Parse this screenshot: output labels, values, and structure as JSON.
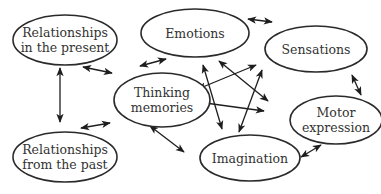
{
  "diagram": {
    "type": "concept-network",
    "colors": {
      "stroke": "#2a2a2a",
      "text": "#333333",
      "background": "#ffffff"
    },
    "nodes": [
      {
        "id": "relationships-present",
        "lines": [
          "Relationships",
          "in the present"
        ],
        "cx": 65,
        "cy": 40,
        "rx": 52,
        "ry": 25
      },
      {
        "id": "emotions",
        "lines": [
          "Emotions"
        ],
        "cx": 195,
        "cy": 33,
        "rx": 54,
        "ry": 24
      },
      {
        "id": "sensations",
        "lines": [
          "Sensations"
        ],
        "cx": 316,
        "cy": 49,
        "rx": 51,
        "ry": 23
      },
      {
        "id": "thinking-memories",
        "lines": [
          "Thinking",
          "memories"
        ],
        "cx": 162,
        "cy": 100,
        "rx": 48,
        "ry": 27
      },
      {
        "id": "motor-expression",
        "lines": [
          "Motor",
          "expression"
        ],
        "cx": 336,
        "cy": 120,
        "rx": 46,
        "ry": 24
      },
      {
        "id": "relationships-past",
        "lines": [
          "Relationships",
          "from the past"
        ],
        "cx": 65,
        "cy": 157,
        "rx": 52,
        "ry": 25
      },
      {
        "id": "imagination",
        "lines": [
          "Imagination"
        ],
        "cx": 250,
        "cy": 158,
        "rx": 50,
        "ry": 23
      }
    ],
    "edges": [
      {
        "from": "relationships-present",
        "to": "relationships-past",
        "x1": 60,
        "y1": 68,
        "x2": 60,
        "y2": 122,
        "bidirectional": true
      },
      {
        "from": "relationships-present",
        "to": "thinking-memories",
        "x1": 83,
        "y1": 67,
        "x2": 112,
        "y2": 73,
        "bidirectional": true
      },
      {
        "from": "thinking-memories",
        "to": "emotions",
        "x1": 140,
        "y1": 66,
        "x2": 166,
        "y2": 59,
        "bidirectional": true
      },
      {
        "from": "emotions",
        "to": "sensations",
        "x1": 248,
        "y1": 19,
        "x2": 272,
        "y2": 22,
        "bidirectional": true
      },
      {
        "from": "sensations",
        "to": "motor-expression",
        "x1": 352,
        "y1": 75,
        "x2": 361,
        "y2": 95,
        "bidirectional": true
      },
      {
        "from": "thinking-memories",
        "to": "relationships-past",
        "x1": 110,
        "y1": 123,
        "x2": 81,
        "y2": 128,
        "bidirectional": true
      },
      {
        "from": "thinking-memories",
        "to": "imagination",
        "x1": 150,
        "y1": 126,
        "x2": 184,
        "y2": 152,
        "bidirectional": true
      },
      {
        "from": "imagination",
        "to": "motor-expression",
        "x1": 301,
        "y1": 157,
        "x2": 321,
        "y2": 145,
        "bidirectional": true
      },
      {
        "from": "thinking-memories",
        "to": "sensations",
        "x1": 198,
        "y1": 89,
        "x2": 256,
        "y2": 65,
        "bidirectional": true
      },
      {
        "from": "thinking-memories",
        "to": "motor-expression",
        "x1": 198,
        "y1": 102,
        "x2": 264,
        "y2": 111,
        "bidirectional": true
      },
      {
        "from": "emotions",
        "to": "imagination",
        "x1": 203,
        "y1": 65,
        "x2": 222,
        "y2": 129,
        "bidirectional": true
      },
      {
        "from": "emotions",
        "to": "motor-expression",
        "x1": 219,
        "y1": 61,
        "x2": 268,
        "y2": 101,
        "bidirectional": true
      },
      {
        "from": "sensations",
        "to": "imagination",
        "x1": 262,
        "y1": 70,
        "x2": 239,
        "y2": 132,
        "bidirectional": true
      }
    ]
  }
}
